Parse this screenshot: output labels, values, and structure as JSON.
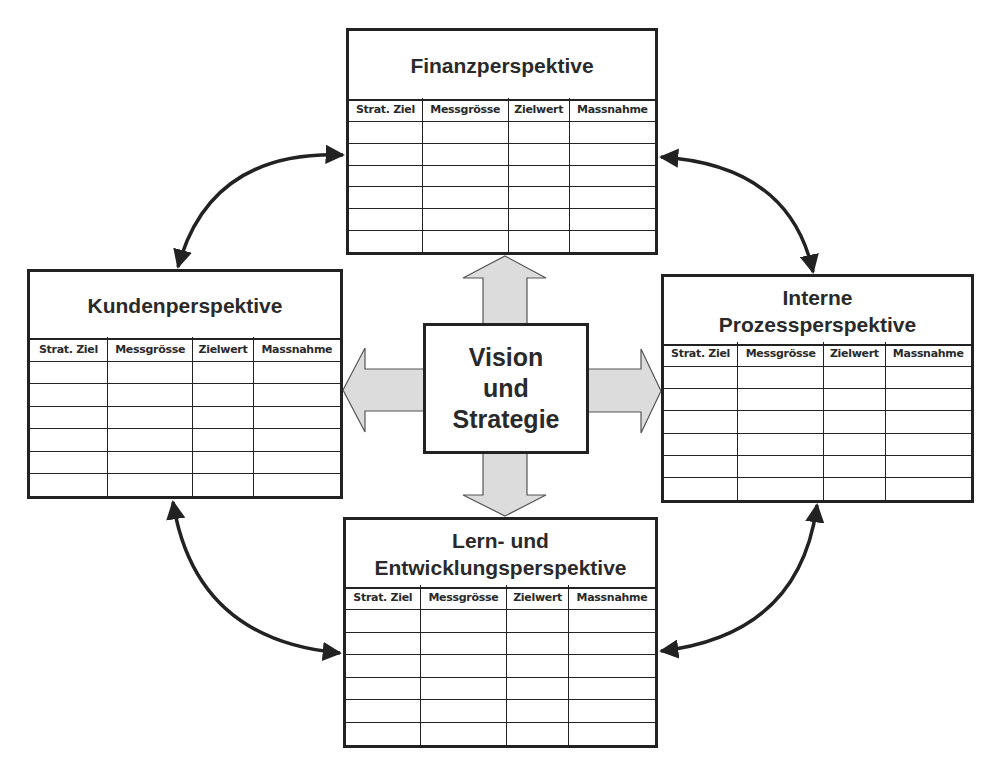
{
  "columns": [
    "Strat. Ziel",
    "Messgrösse",
    "Zielwert",
    "Massnahme"
  ],
  "center": {
    "lines": [
      "Vision",
      "und",
      "Strategie"
    ]
  },
  "perspectives": {
    "finanz": {
      "title_lines": [
        "Finanzperspektive"
      ],
      "rows": 6
    },
    "kunden": {
      "title_lines": [
        "Kundenperspektive"
      ],
      "rows": 6
    },
    "prozess": {
      "title_lines": [
        "Interne",
        "Prozessperspektive"
      ],
      "rows": 6
    },
    "lernen": {
      "title_lines": [
        "Lern- und",
        "Entwicklungsperspektive"
      ],
      "rows": 6
    }
  },
  "colors": {
    "line": "#222222",
    "block_arrow_fill": "#dcdcdc",
    "block_arrow_stroke": "#555555",
    "background": "#ffffff"
  }
}
